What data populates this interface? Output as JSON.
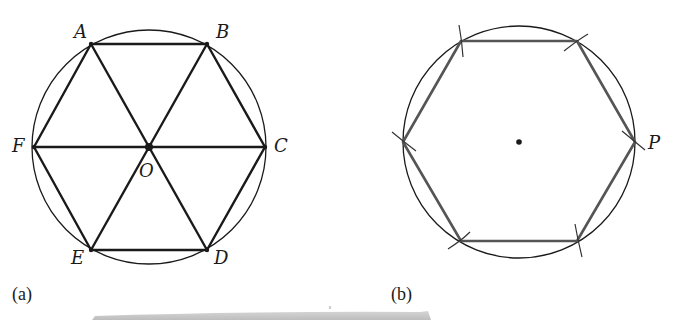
{
  "figure_a": {
    "caption": "(a)",
    "center_label": "O",
    "vertex_labels": {
      "A": "A",
      "B": "B",
      "C": "C",
      "D": "D",
      "E": "E",
      "F": "F"
    },
    "description": "Regular hexagon ABCDEF inscribed in a circle with center O; diagonals AD, BE, CF divide it into six equilateral triangles"
  },
  "figure_b": {
    "caption": "(b)",
    "point_label": "P",
    "description": "Regular hexagon constructed inside a circle using compass arcs marked at each vertex, starting from point P"
  },
  "colors": {
    "line": "#1a1a1a",
    "hexagon_b": "#555555",
    "background": "#ffffff",
    "page_fold": "#bdbdbd"
  }
}
